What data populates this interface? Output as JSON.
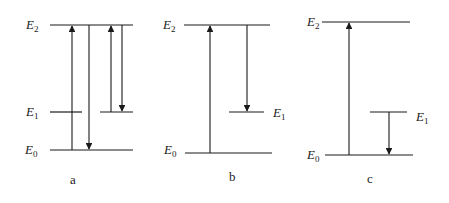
{
  "diagram": {
    "type": "energy-level-transitions",
    "panels": [
      {
        "caption": "a",
        "levels": [
          {
            "name": "E",
            "sub": "2",
            "label": "E2"
          },
          {
            "name": "E",
            "sub": "1",
            "label": "E1"
          },
          {
            "name": "E",
            "sub": "0",
            "label": "E0"
          }
        ],
        "transitions": [
          {
            "from": "E0",
            "to": "E2",
            "direction": "up"
          },
          {
            "from": "E2",
            "to": "E0",
            "direction": "down"
          },
          {
            "from": "E1",
            "to": "E2",
            "direction": "up"
          },
          {
            "from": "E2",
            "to": "E1",
            "direction": "down"
          }
        ]
      },
      {
        "caption": "b",
        "levels": [
          {
            "name": "E",
            "sub": "2",
            "label": "E2"
          },
          {
            "name": "E",
            "sub": "1",
            "label": "E1"
          },
          {
            "name": "E",
            "sub": "0",
            "label": "E0"
          }
        ],
        "transitions": [
          {
            "from": "E0",
            "to": "E2",
            "direction": "up"
          },
          {
            "from": "E2",
            "to": "E1",
            "direction": "down"
          }
        ]
      },
      {
        "caption": "c",
        "levels": [
          {
            "name": "E",
            "sub": "2",
            "label": "E2"
          },
          {
            "name": "E",
            "sub": "1",
            "label": "E1"
          },
          {
            "name": "E",
            "sub": "0",
            "label": "E0"
          }
        ],
        "transitions": [
          {
            "from": "E0",
            "to": "E2",
            "direction": "up"
          },
          {
            "from": "E1",
            "to": "E0",
            "direction": "down"
          }
        ]
      }
    ]
  }
}
